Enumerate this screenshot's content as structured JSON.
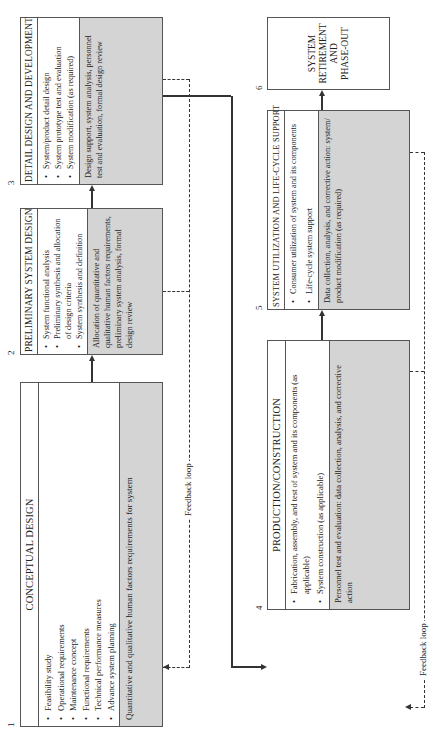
{
  "diagram": {
    "type": "system-life-cycle-flow",
    "orientation": "rotated-90-ccw",
    "colors": {
      "box_border": "#555555",
      "shaded_section": "#d4d4d4",
      "lines": "#333333"
    },
    "boxes": [
      {
        "number": "1",
        "title": "CONCEPTUAL DESIGN",
        "bullets": [
          "Feasibility study",
          "Operational requirements",
          "Maintenance concept",
          "Functional requirements",
          "Technical performance measures",
          "Advance system planning"
        ],
        "human_factors": "Quantitative and qualitative human factors requirements for system"
      },
      {
        "number": "2",
        "title": "PRELIMINARY SYSTEM DESIGN",
        "bullets": [
          "System functional analysis",
          "Preliminary synthesis and allocation of design criteria",
          "System synthesis and definition"
        ],
        "human_factors": "Allocation of quantitative and qualitative human factors requirements, preliminary system analysis, formal design review"
      },
      {
        "number": "3",
        "title": "DETAIL DESIGN AND DEVELOPMENT",
        "bullets": [
          "System/product detail design",
          "System prototype test and evaluation",
          "System modification (as required)"
        ],
        "human_factors": "Design support, system analysis, personnel test and evaluation, formal design review"
      },
      {
        "number": "4",
        "title": "PRODUCTION/CONSTRUCTION",
        "bullets": [
          "Fabrication, assembly, and test of system and its components (as applicable)",
          "System construction (as applicable)"
        ],
        "human_factors": "Personnel test and evaluation: data collection, analysis, and corrective action"
      },
      {
        "number": "5",
        "title": "SYSTEM UTILIZATION AND LIFE-CYCLE SUPPORT",
        "bullets": [
          "Consumer utilization of system and its components",
          "Life-cycle system support"
        ],
        "human_factors": "Data collection, analysis, and corrective action: system/ product modification (as required)"
      },
      {
        "number": "6",
        "title_lines": [
          "SYSTEM",
          "RETIREMENT",
          "AND",
          "PHASE-OUT"
        ]
      }
    ],
    "feedback_labels": [
      "Feedback loop",
      "Feedback loop"
    ]
  }
}
